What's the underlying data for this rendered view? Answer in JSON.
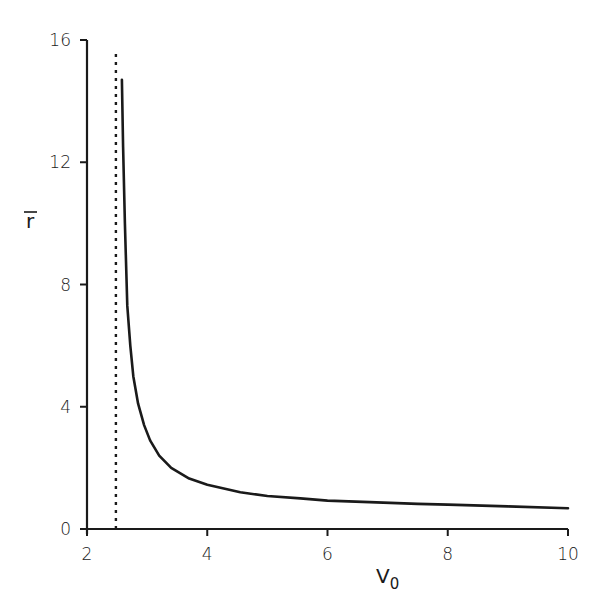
{
  "chart_data": {
    "type": "line",
    "title": "",
    "xlabel": "V0",
    "xlabel_main": "V",
    "xlabel_sub": "0",
    "ylabel": "r̄",
    "xlim": [
      2,
      10
    ],
    "ylim": [
      0,
      16
    ],
    "xticks": [
      2,
      4,
      6,
      8,
      10
    ],
    "yticks": [
      0,
      4,
      8,
      12,
      16
    ],
    "grid": false,
    "legend": null,
    "series": [
      {
        "name": "r̄ vs V0",
        "style": "solid",
        "x": [
          2.58,
          2.6,
          2.63,
          2.67,
          2.72,
          2.77,
          2.85,
          2.95,
          3.05,
          3.2,
          3.4,
          3.7,
          4.0,
          4.55,
          5.0,
          5.55,
          6.0,
          6.7,
          7.5,
          8.0,
          9.0,
          10.0
        ],
        "y": [
          14.7,
          12.5,
          10.0,
          7.3,
          6.0,
          5.0,
          4.1,
          3.4,
          2.9,
          2.4,
          2.0,
          1.65,
          1.45,
          1.2,
          1.08,
          1.0,
          0.93,
          0.88,
          0.82,
          0.8,
          0.74,
          0.68
        ]
      },
      {
        "name": "asymptote",
        "style": "dotted",
        "x": [
          2.48,
          2.48
        ],
        "y": [
          0,
          15.7
        ]
      }
    ]
  },
  "labels": {
    "x_ticks": [
      "2",
      "4",
      "6",
      "8",
      "10"
    ],
    "y_ticks": [
      "0",
      "4",
      "8",
      "12",
      "16"
    ],
    "x_axis_main": "V",
    "x_axis_sub": "0",
    "y_axis": "r"
  }
}
